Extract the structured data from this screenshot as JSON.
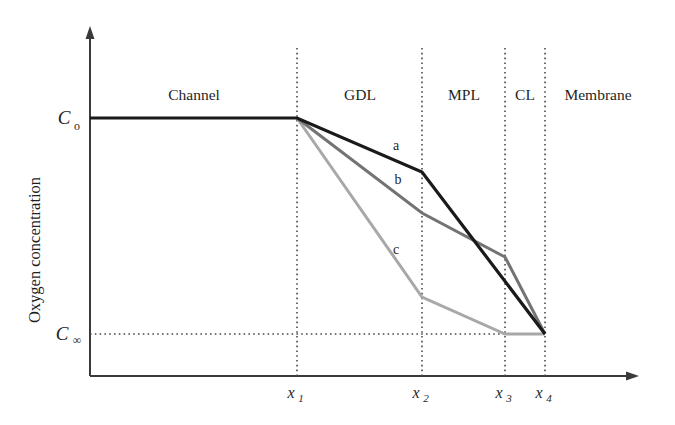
{
  "figure": {
    "type": "line-diagram",
    "background": "#ffffff"
  },
  "axes": {
    "y_axis_title": "Oxygen concentration",
    "y_ticks": [
      {
        "label": "C",
        "sub": "o",
        "value_name": "C_o",
        "y_px": 118
      },
      {
        "label": "C",
        "sub": "∞",
        "value_name": "C_infinity",
        "y_px": 334
      }
    ],
    "x_ticks": [
      {
        "label": "x",
        "sub": "1",
        "x_px": 297
      },
      {
        "label": "x",
        "sub": "2",
        "x_px": 422
      },
      {
        "label": "x",
        "sub": "3",
        "x_px": 505
      },
      {
        "label": "x",
        "sub": "4",
        "x_px": 545
      }
    ],
    "origin_px": {
      "x": 90,
      "y": 376
    },
    "x_axis_end_px": 638,
    "y_axis_top_px": 28,
    "axis_color": "#3a3a3a",
    "grid_color": "#4a4a4a",
    "grid_style": "dotted"
  },
  "regions": [
    {
      "name": "Channel",
      "label": "Channel",
      "center_x_px": 194
    },
    {
      "name": "GDL",
      "label": "GDL",
      "center_x_px": 360
    },
    {
      "name": "MPL",
      "label": "MPL",
      "center_x_px": 464
    },
    {
      "name": "CL",
      "label": "CL",
      "center_x_px": 525
    },
    {
      "name": "Membrane",
      "label": "Membrane",
      "center_x_px": 598
    }
  ],
  "chart_data": {
    "type": "line",
    "title": "",
    "xlabel": "",
    "ylabel": "Oxygen concentration",
    "xlim": [
      90,
      638
    ],
    "ylim": [
      376,
      28
    ],
    "grid": true,
    "legend": "inline-curve-labels",
    "x_tick_labels": [
      "x₁",
      "x₂",
      "x₃",
      "x₄"
    ],
    "y_tick_labels": [
      "C₀",
      "C∞"
    ],
    "region_boundaries_px": [
      297,
      422,
      505,
      545
    ],
    "series": [
      {
        "name": "a",
        "label": "a",
        "color": "#1a1a1a",
        "width": 3.2,
        "label_pos_px": {
          "x": 396,
          "y": 150
        },
        "points_px": [
          {
            "x": 90,
            "y": 118
          },
          {
            "x": 297,
            "y": 118
          },
          {
            "x": 422,
            "y": 172
          },
          {
            "x": 545,
            "y": 334
          }
        ]
      },
      {
        "name": "b",
        "label": "b",
        "color": "#737373",
        "width": 3.0,
        "label_pos_px": {
          "x": 398,
          "y": 184
        },
        "points_px": [
          {
            "x": 297,
            "y": 118
          },
          {
            "x": 422,
            "y": 213
          },
          {
            "x": 505,
            "y": 257
          },
          {
            "x": 545,
            "y": 334
          }
        ]
      },
      {
        "name": "c",
        "label": "c",
        "color": "#a8a8a8",
        "width": 3.0,
        "label_pos_px": {
          "x": 396,
          "y": 254
        },
        "points_px": [
          {
            "x": 297,
            "y": 118
          },
          {
            "x": 422,
            "y": 297
          },
          {
            "x": 505,
            "y": 334
          },
          {
            "x": 545,
            "y": 334
          }
        ]
      }
    ],
    "annotations": [
      {
        "text": "Channel",
        "x_px": 194,
        "y_px": 100
      },
      {
        "text": "GDL",
        "x_px": 360,
        "y_px": 100
      },
      {
        "text": "MPL",
        "x_px": 464,
        "y_px": 100
      },
      {
        "text": "CL",
        "x_px": 525,
        "y_px": 100
      },
      {
        "text": "Membrane",
        "x_px": 598,
        "y_px": 100
      }
    ]
  }
}
